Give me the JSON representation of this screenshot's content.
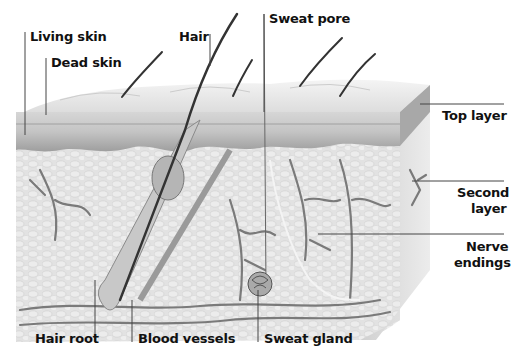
{
  "diagram": {
    "labels": {
      "living_skin": "Living skin",
      "dead_skin": "Dead skin",
      "hair": "Hair",
      "sweat_pore": "Sweat pore",
      "top_layer": "Top layer",
      "second_layer_1": "Second",
      "second_layer_2": "layer",
      "nerve_endings_1": "Nerve",
      "nerve_endings_2": "endings",
      "hair_root": "Hair root",
      "blood_vessels": "Blood vessels",
      "sweat_gland": "Sweat gland"
    },
    "colors": {
      "background": "#ffffff",
      "skin_surface": "#e6e6e6",
      "epidermis": "#bdbdbd",
      "dermis": "#dcdcdc",
      "vessel": "#7a7a7a",
      "hair": "#333333",
      "leader_line": "#444444"
    }
  }
}
